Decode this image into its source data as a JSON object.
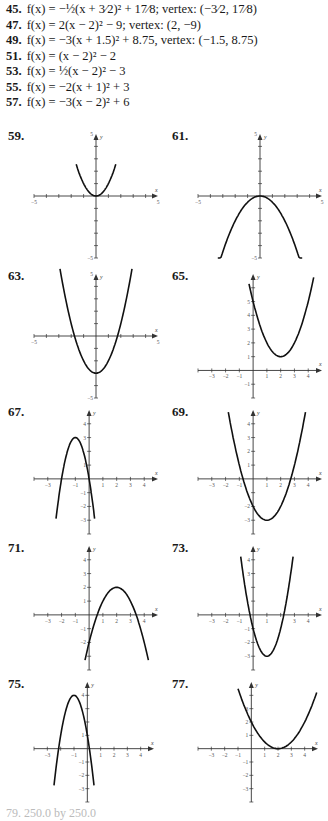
{
  "answers": [
    {
      "num": "45.",
      "text": "f(x) = −½(x + 3⁄2)² + 17⁄8; vertex: (−3⁄2, 17⁄8)"
    },
    {
      "num": "47.",
      "text": "f(x) = 2(x − 2)² − 9; vertex: (2, −9)"
    },
    {
      "num": "49.",
      "text": "f(x) = −3(x + 1.5)² + 8.75, vertex: (−1.5, 8.75)"
    },
    {
      "num": "51.",
      "text": "f(x) = (x − 2)² − 2"
    },
    {
      "num": "53.",
      "text": "f(x) = ½(x − 2)² − 3"
    },
    {
      "num": "55.",
      "text": "f(x) = −2(x + 1)² + 3"
    },
    {
      "num": "57.",
      "text": "f(x) = −3(x − 2)² + 6"
    }
  ],
  "graphs": [
    {
      "label": "59.",
      "x": 8,
      "y": 128,
      "a": 1,
      "h": 0,
      "k": 0,
      "style": "wide",
      "xmin": -5,
      "xmax": 5,
      "ymin": -5,
      "ymax": 5,
      "xticks": [
        -5,
        5
      ],
      "yticks": [
        5,
        -5
      ],
      "curve_x": [
        -1.6,
        1.6
      ]
    },
    {
      "label": "61.",
      "x": 172,
      "y": 128,
      "a": -0.5,
      "h": 0,
      "k": 0,
      "style": "wide",
      "xmin": -5,
      "xmax": 5,
      "ymin": -5,
      "ymax": 5,
      "xticks": [
        -5,
        5
      ],
      "yticks": [
        5,
        -5
      ],
      "curve_x": [
        -3.4,
        3.4
      ]
    },
    {
      "label": "63.",
      "x": 8,
      "y": 268,
      "a": 1,
      "h": 0,
      "k": -3,
      "style": "wide",
      "xmin": -5,
      "xmax": 5,
      "ymin": -5,
      "ymax": 5,
      "xticks": [
        -5,
        5
      ],
      "yticks": [
        5,
        -5
      ],
      "curve_x": [
        -2.9,
        2.9
      ]
    },
    {
      "label": "65.",
      "x": 172,
      "y": 268,
      "a": 1,
      "h": 2,
      "k": 1,
      "style": "unit",
      "xmin": -4,
      "xmax": 5,
      "ymin": -2,
      "ymax": 7,
      "xticks": [
        -3,
        -2,
        -1,
        1,
        2,
        3,
        4
      ],
      "yticks": [
        1,
        2,
        3,
        4,
        5,
        -1
      ],
      "curve_x": [
        -0.3,
        4.4
      ]
    },
    {
      "label": "67.",
      "x": 8,
      "y": 404,
      "a": -3,
      "h": -1,
      "k": 3,
      "style": "unit",
      "xmin": -4,
      "xmax": 5,
      "ymin": -4,
      "ymax": 5,
      "xticks": [
        -3,
        -1,
        1,
        2,
        3,
        4
      ],
      "yticks": [
        4,
        3,
        1,
        -1,
        -2,
        -3
      ],
      "curve_x": [
        -2.4,
        0.4
      ]
    },
    {
      "label": "69.",
      "x": 172,
      "y": 404,
      "a": 1,
      "h": 1,
      "k": -3,
      "style": "unit",
      "xmin": -4,
      "xmax": 5,
      "ymin": -4,
      "ymax": 5,
      "xticks": [
        -3,
        -2,
        -1,
        1,
        2,
        3,
        4
      ],
      "yticks": [
        4,
        3,
        2,
        1,
        -2,
        -3
      ],
      "curve_x": [
        -1.8,
        3.8
      ]
    },
    {
      "label": "71.",
      "x": 8,
      "y": 540,
      "a": -1,
      "h": 2,
      "k": 2,
      "style": "unit",
      "xmin": -4,
      "xmax": 5,
      "ymin": -4,
      "ymax": 5,
      "xticks": [
        -3,
        -2,
        -1,
        1,
        2,
        3,
        4
      ],
      "yticks": [
        4,
        3,
        2,
        1,
        -1,
        -2
      ],
      "curve_x": [
        -0.3,
        4.3
      ]
    },
    {
      "label": "73.",
      "x": 172,
      "y": 540,
      "a": 2,
      "h": 1,
      "k": -3,
      "style": "unit",
      "xmin": -4,
      "xmax": 5,
      "ymin": -4,
      "ymax": 5,
      "xticks": [
        -3,
        -2,
        -1,
        1,
        3,
        4
      ],
      "yticks": [
        4,
        3,
        -1,
        -2,
        -3
      ],
      "curve_x": [
        -0.9,
        2.9
      ]
    },
    {
      "label": "75.",
      "x": 8,
      "y": 676,
      "a": -3,
      "h": -1,
      "k": 4,
      "style": "unit",
      "xmin": -4,
      "xmax": 5,
      "ymin": -4,
      "ymax": 5,
      "xticks": [
        -3,
        -1,
        1,
        2,
        3,
        4
      ],
      "yticks": [
        4,
        1,
        -1,
        -2,
        -3
      ],
      "curve_x": [
        -2.5,
        0.5
      ]
    },
    {
      "label": "77.",
      "x": 172,
      "y": 676,
      "a": 0.5,
      "h": 2,
      "k": 0,
      "style": "unit",
      "xmin": -4,
      "xmax": 5,
      "ymin": -4,
      "ymax": 5,
      "xticks": [
        -3,
        -2,
        -1,
        1,
        2,
        3,
        4
      ],
      "yticks": [
        3,
        2,
        1,
        -1,
        -2,
        -3
      ],
      "curve_x": [
        -1,
        4.9
      ]
    }
  ],
  "axis_names": {
    "x": "x",
    "y": "y"
  },
  "footer": {
    "text": "79.  250.0 by 250.0"
  }
}
